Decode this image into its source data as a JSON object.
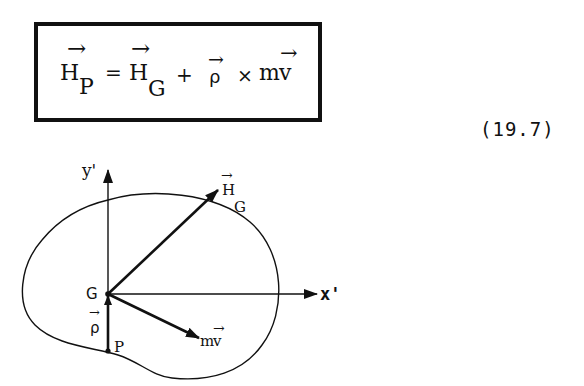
{
  "equation": {
    "lhs_symbol": "H",
    "lhs_subscript": "P",
    "equals": "=",
    "term1_symbol": "H",
    "term1_subscript": "G",
    "plus": "+",
    "term2_symbol": "ρ",
    "times": "×",
    "term3_mass": "m",
    "term3_velocity": "v",
    "vector_arrow": "→",
    "number": "(19.7)"
  },
  "diagram": {
    "y_axis_label": "y'",
    "x_axis_label": "x'",
    "origin_label": "G",
    "point_label": "P",
    "rho_label": "ρ",
    "hg_label_symbol": "H",
    "hg_label_subscript": "G",
    "mv_label_mass": "m",
    "mv_label_velocity": "v",
    "vector_arrow": "→"
  }
}
